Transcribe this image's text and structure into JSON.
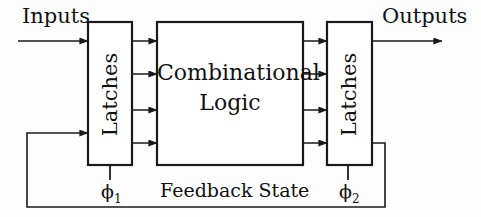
{
  "diagram": {
    "labels": {
      "inputs": "Inputs",
      "outputs": "Outputs",
      "combinational_line1": "Combinational",
      "combinational_line2": "Logic",
      "latches_left": "Latches",
      "latches_right": "Latches",
      "feedback_state": "Feedback State",
      "clock_phi1": "ϕ1",
      "clock_phi2": "ϕ2"
    },
    "blocks": [
      {
        "name": "latches-left",
        "label": "Latches",
        "x": 88,
        "y": 22,
        "width": 44,
        "height": 143
      },
      {
        "name": "combinational-logic",
        "label": "Combinational Logic",
        "x": 157,
        "y": 22,
        "width": 146,
        "height": 143
      },
      {
        "name": "latches-right",
        "label": "Latches",
        "x": 327,
        "y": 22,
        "width": 45,
        "height": 143
      }
    ],
    "signal_rows_y": [
      41,
      74,
      110,
      143
    ],
    "feedback_bus_y": 207,
    "colors": {
      "stroke": "#1a1a1a",
      "text": "#111111",
      "background": "#fdfdfd"
    }
  }
}
